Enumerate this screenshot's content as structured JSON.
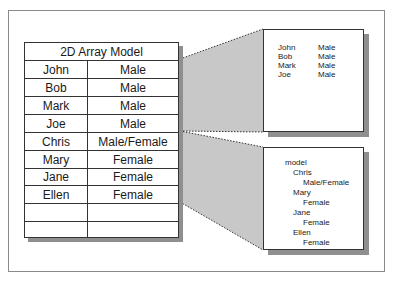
{
  "table": {
    "title": "2D Array Model",
    "rows": [
      {
        "name": "John",
        "gender": "Male"
      },
      {
        "name": "Bob",
        "gender": "Male"
      },
      {
        "name": "Mark",
        "gender": "Male"
      },
      {
        "name": "Joe",
        "gender": "Male"
      },
      {
        "name": "Chris",
        "gender": "Male/Female"
      },
      {
        "name": "Mary",
        "gender": "Female"
      },
      {
        "name": "Jane",
        "gender": "Female"
      },
      {
        "name": "Ellen",
        "gender": "Female"
      },
      {
        "name": "",
        "gender": ""
      },
      {
        "name": "",
        "gender": ""
      }
    ]
  },
  "flat_view": {
    "rows": [
      {
        "name": "John",
        "gender": "Male"
      },
      {
        "name": "Bob",
        "gender": "Male"
      },
      {
        "name": "Mark",
        "gender": "Male"
      },
      {
        "name": "Joe",
        "gender": "Male"
      }
    ]
  },
  "tree_view": {
    "root": "model",
    "nodes": [
      {
        "name": "Chris",
        "gender": "Male/Female"
      },
      {
        "name": "Mary",
        "gender": "Female"
      },
      {
        "name": "Jane",
        "gender": "Female"
      },
      {
        "name": "Ellen",
        "gender": "Female"
      }
    ]
  },
  "colors": {
    "projection_fill": "#c8c8c8",
    "shadow": "#8f8f8f",
    "border": "#333333"
  }
}
